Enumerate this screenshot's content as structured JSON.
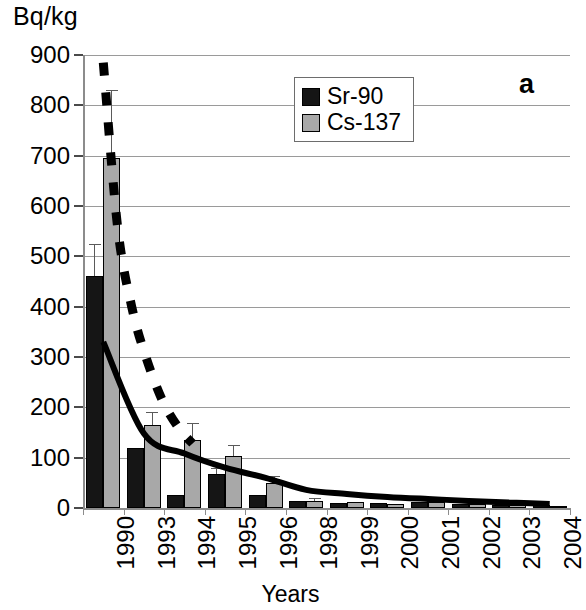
{
  "chart_data": {
    "type": "bar",
    "title": "",
    "panel_label": "a",
    "xlabel": "Years",
    "ylabel": "Bq/kg",
    "ylim": [
      0,
      900
    ],
    "ytick_step": 100,
    "yticks": [
      0,
      100,
      200,
      300,
      400,
      500,
      600,
      700,
      800,
      900
    ],
    "grid": true,
    "legend_position": "top-center",
    "categories": [
      "1990",
      "1993",
      "1994",
      "1995",
      "1996",
      "1998",
      "1999",
      "2000",
      "2001",
      "2002",
      "2003",
      "2004"
    ],
    "series": [
      {
        "name": "Sr-90",
        "color": "#151515",
        "values": [
          460,
          120,
          25,
          67,
          25,
          14,
          10,
          9,
          11,
          7,
          6,
          5
        ],
        "errors": [
          65,
          0,
          0,
          12,
          0,
          0,
          0,
          0,
          0,
          0,
          0,
          0
        ]
      },
      {
        "name": "Cs-137",
        "color": "#a8a8a8",
        "values": [
          695,
          165,
          135,
          103,
          50,
          14,
          11,
          8,
          12,
          7,
          5,
          4
        ],
        "errors": [
          135,
          25,
          33,
          22,
          13,
          6,
          0,
          0,
          0,
          0,
          0,
          0
        ]
      }
    ],
    "curves": [
      {
        "name": "Sr-90 fitted decay",
        "style": "solid",
        "color": "#000000",
        "start_value": 330,
        "end_value": 5,
        "points": [
          [
            0,
            330
          ],
          [
            1,
            148
          ],
          [
            2,
            108
          ],
          [
            3,
            80
          ],
          [
            4,
            60
          ],
          [
            5,
            36
          ],
          [
            6,
            28
          ],
          [
            7,
            22
          ],
          [
            8,
            18
          ],
          [
            9,
            14
          ],
          [
            10,
            11
          ],
          [
            11,
            8
          ]
        ]
      },
      {
        "name": "Cs-137 fitted decay",
        "style": "dashed",
        "color": "#000000",
        "start_value": 885,
        "end_value": 120,
        "points": [
          [
            0,
            885
          ],
          [
            0.35,
            560
          ],
          [
            0.7,
            400
          ],
          [
            1.05,
            300
          ],
          [
            1.45,
            215
          ],
          [
            1.85,
            160
          ],
          [
            2.2,
            128
          ]
        ]
      }
    ]
  },
  "legend": {
    "entries": [
      {
        "label": "Sr-90",
        "swatch": "black-square"
      },
      {
        "label": "Cs-137",
        "swatch": "gray-square"
      }
    ]
  }
}
